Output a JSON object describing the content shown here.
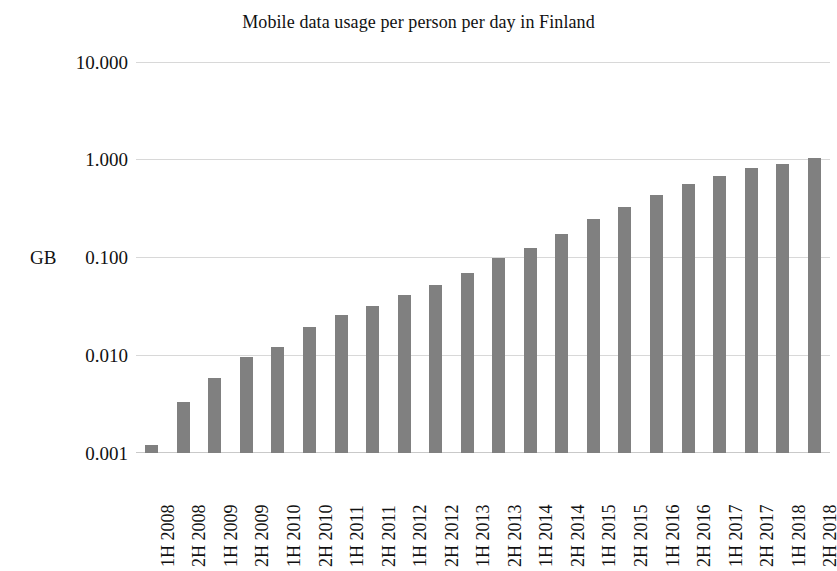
{
  "chart_data": {
    "type": "bar",
    "title": "Mobile data usage per person per day in Finland",
    "xlabel": "",
    "ylabel": "GB",
    "yscale": "log",
    "ylim": [
      0.001,
      10.0
    ],
    "ytick_labels": [
      "10.000",
      "1.000",
      "0.100",
      "0.010",
      "0.001"
    ],
    "ytick_values": [
      10.0,
      1.0,
      0.1,
      0.01,
      0.001
    ],
    "grid": true,
    "legend": "none",
    "bar_color": "#808080",
    "gridline_color": "#d8d8d8",
    "categories": [
      "1H 2008",
      "2H 2008",
      "1H 2009",
      "2H 2009",
      "1H 2010",
      "2H 2010",
      "1H 2011",
      "2H 2011",
      "1H 2012",
      "2H 2012",
      "1H 2013",
      "2H 2013",
      "1H 2014",
      "2H 2014",
      "1H 2015",
      "2H 2015",
      "1H 2016",
      "2H 2016",
      "1H 2017",
      "2H 2017",
      "1H 2018",
      "2H 2018"
    ],
    "values": [
      0.0012,
      0.0033,
      0.0058,
      0.0095,
      0.0122,
      0.0195,
      0.0258,
      0.0322,
      0.0415,
      0.052,
      0.07,
      0.098,
      0.125,
      0.175,
      0.245,
      0.33,
      0.44,
      0.57,
      0.68,
      0.82,
      0.9,
      1.05
    ]
  }
}
